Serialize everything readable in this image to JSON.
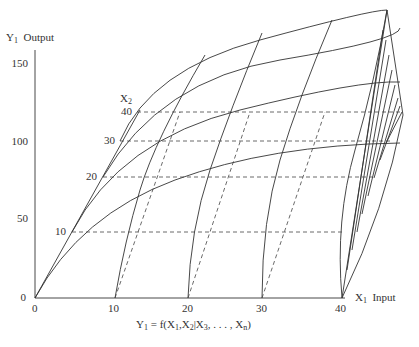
{
  "diagram": {
    "y_axis": {
      "symbol": "Y",
      "subscript": "1",
      "label": "Output",
      "ticks": [
        "150",
        "100",
        "50",
        "0"
      ]
    },
    "x1_axis": {
      "symbol": "X",
      "subscript": "1",
      "label": "Input",
      "ticks": [
        "0",
        "10",
        "20",
        "30",
        "40"
      ]
    },
    "x2_axis": {
      "symbol": "X",
      "subscript": "2",
      "ticks": [
        "10",
        "20",
        "30",
        "40"
      ]
    },
    "formula": {
      "lhs": "Y",
      "lhs_sub": "1",
      "eq": " = f(X",
      "s1": "1",
      "mid": ",X",
      "s2": "2",
      "bar": "|X",
      "s3": "3",
      "dots": ", . . . , X",
      "sn": "n",
      "end": ")"
    },
    "colors": {
      "line": "#333333",
      "dashed": "#444444",
      "background": "#ffffff"
    }
  }
}
